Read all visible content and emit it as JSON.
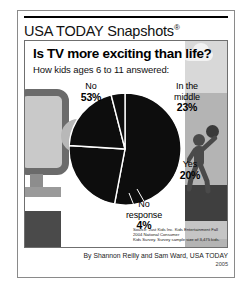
{
  "masthead": {
    "title": "USA TODAY Snapshots",
    "registered_mark": "®"
  },
  "headline": "Is TV more exciting than life?",
  "subhead": "How kids ages 6 to 11 answered:",
  "labels": {
    "no": {
      "category": "No",
      "percent": "53%"
    },
    "middle_l1": "In the",
    "middle_l2": "middle",
    "middle_pct": "23%",
    "yes": {
      "category": "Yes",
      "percent": "20%"
    },
    "noresponse_l1": "No",
    "noresponse_l2": "response",
    "noresponse_pct": "4%"
  },
  "source_line1": "Source: Just Kids Inc. Kids Entertainment Fall 2004 National Consumer",
  "source_line2": "Kids Survey. Survey sample size of 3,475 kids.",
  "byline": "By Shannon Reilly and Sam Ward, USA TODAY",
  "year": "2005",
  "colors": {
    "pie_slice": "#0d0d0d",
    "divider": "#ffffff",
    "frame": "#8a8a8a",
    "illustration_gray": "#b4b4b4",
    "tv_screen": "#c9c9c9"
  },
  "chart_data": {
    "type": "pie",
    "title": "Is TV more exciting than life?",
    "subtitle": "How kids ages 6 to 11 answered:",
    "categories": [
      "No",
      "In the middle",
      "Yes",
      "No response"
    ],
    "values": [
      53,
      23,
      20,
      4
    ],
    "value_labels": [
      "53%",
      "23%",
      "20%",
      "4%"
    ],
    "unit": "percent",
    "legend": "labels placed around pie with leader lines",
    "grid": false,
    "slice_color": "#0d0d0d",
    "divider_color": "#ffffff",
    "start_angle_deg": -90,
    "direction": "clockwise",
    "source": "Just Kids Inc. Kids Entertainment Fall 2004 National Consumer Kids Survey. Survey sample size of 3,475 kids."
  }
}
